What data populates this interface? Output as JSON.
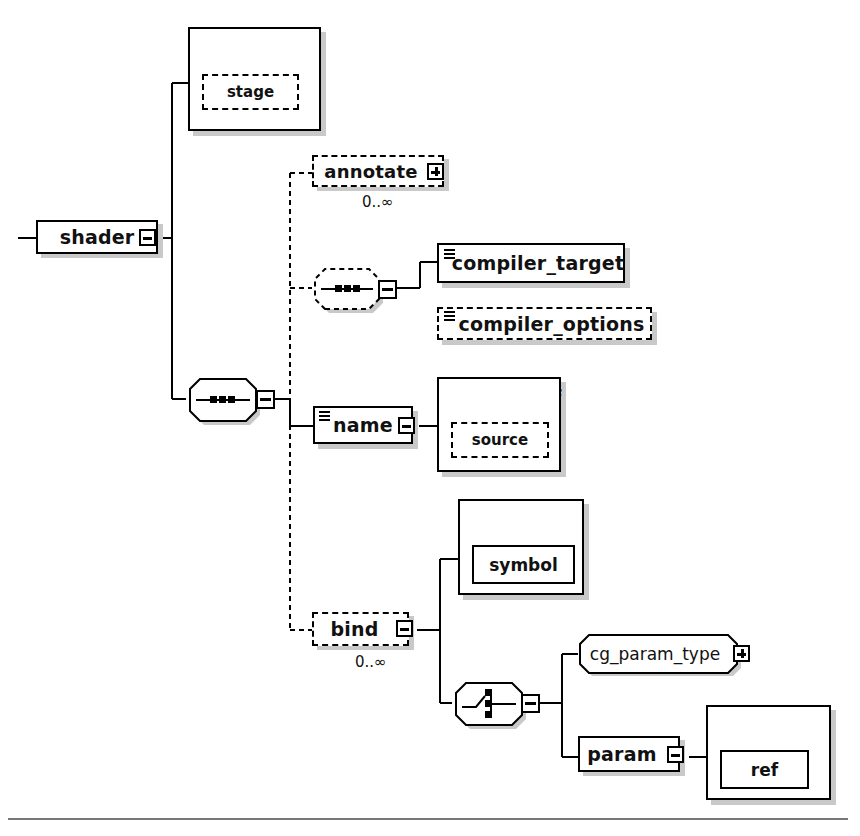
{
  "diagram": {
    "type": "xml-schema-diagram",
    "root": "shader",
    "colors": {
      "line": "#000000",
      "shadow": "#c9c9c9",
      "background": "#ffffff",
      "rule": "#777777"
    }
  },
  "nodes": {
    "shader": {
      "label": "shader",
      "shape": "element-box",
      "border": "solid",
      "toggle": "minus",
      "content_icon": "none"
    },
    "shader_attributes": {
      "label": "attributes",
      "shape": "group-frame",
      "toggle": "minus"
    },
    "stage": {
      "label": "stage",
      "shape": "attribute-box",
      "border": "dashed"
    },
    "annotate": {
      "label": "annotate",
      "shape": "element-box",
      "border": "dashed",
      "toggle": "plus",
      "cardinality": "0..∞"
    },
    "compiler_sequence": {
      "label": "sequence",
      "shape": "sequence-octagon",
      "border": "dashed",
      "toggle": "minus"
    },
    "compiler_target": {
      "label": "compiler_target",
      "shape": "element-box",
      "border": "solid",
      "content_icon": "text-lines"
    },
    "compiler_options": {
      "label": "compiler_options",
      "shape": "element-box",
      "border": "dashed",
      "content_icon": "text-lines"
    },
    "main_sequence": {
      "label": "sequence",
      "shape": "sequence-octagon",
      "border": "solid",
      "toggle": "minus"
    },
    "name": {
      "label": "name",
      "shape": "element-box",
      "border": "solid",
      "toggle": "minus",
      "content_icon": "text-lines"
    },
    "name_attributes": {
      "label": "attributes",
      "shape": "group-frame",
      "toggle": "minus"
    },
    "source": {
      "label": "source",
      "shape": "attribute-box",
      "border": "dashed"
    },
    "bind": {
      "label": "bind",
      "shape": "element-box",
      "border": "dashed",
      "toggle": "minus",
      "cardinality": "0..∞"
    },
    "bind_attributes": {
      "label": "attributes",
      "shape": "group-frame",
      "toggle": "minus"
    },
    "symbol": {
      "label": "symbol",
      "shape": "attribute-box",
      "border": "solid"
    },
    "bind_choice": {
      "label": "choice",
      "shape": "choice-octagon",
      "border": "solid",
      "toggle": "minus"
    },
    "cg_param_type": {
      "label": "cg_param_type",
      "shape": "type-octagon",
      "border": "solid",
      "toggle": "plus"
    },
    "param": {
      "label": "param",
      "shape": "element-box",
      "border": "solid",
      "toggle": "minus"
    },
    "param_attributes": {
      "label": "attributes",
      "shape": "group-frame",
      "toggle": "minus"
    },
    "ref": {
      "label": "ref",
      "shape": "attribute-box",
      "border": "solid"
    }
  }
}
